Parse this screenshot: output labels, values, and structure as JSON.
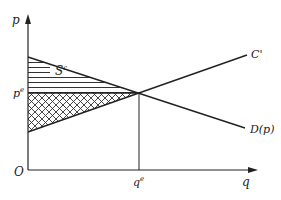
{
  "diagram": {
    "type": "supply-demand surplus diagram",
    "axes": {
      "y_label": "p",
      "x_label": "q",
      "origin_label": "O"
    },
    "curves": {
      "supply_label": "C'",
      "demand_label": "D(p)"
    },
    "equilibrium": {
      "price_label": "p",
      "price_sup": "e",
      "quantity_label": "q",
      "quantity_sup": "e"
    },
    "regions": {
      "consumer_surplus_label": "S",
      "consumer_surplus_sup": "c",
      "consumer_surplus_fill": "horizontal-lines",
      "producer_surplus_fill": "cross-hatch"
    },
    "colors": {
      "line": "#222222",
      "background": "#ffffff"
    }
  }
}
